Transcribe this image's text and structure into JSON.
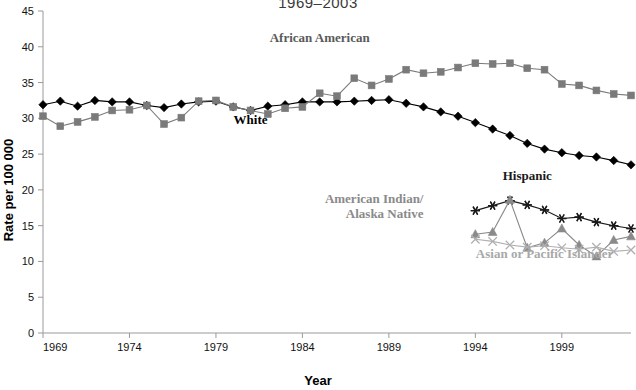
{
  "chart_data": {
    "type": "line",
    "title": "1969–2003",
    "xlabel": "Year",
    "ylabel": "Rate per 100 000",
    "xlim": [
      1969,
      2003
    ],
    "ylim": [
      0,
      45
    ],
    "ytick_step": 5,
    "ytick_labels": [
      "0",
      "5",
      "10",
      "15",
      "20",
      "25",
      "30",
      "35",
      "40",
      "45"
    ],
    "xtick_labels": [
      "1969",
      "1974",
      "1979",
      "1984",
      "1989",
      "1994",
      "1999"
    ],
    "xticks": [
      1969,
      1974,
      1979,
      1984,
      1989,
      1994,
      1999
    ],
    "grid": false,
    "legend_position": "inline-annotations",
    "x": [
      1969,
      1970,
      1971,
      1972,
      1973,
      1974,
      1975,
      1976,
      1977,
      1978,
      1979,
      1980,
      1981,
      1982,
      1983,
      1984,
      1985,
      1986,
      1987,
      1988,
      1989,
      1990,
      1991,
      1992,
      1993,
      1994,
      1995,
      1996,
      1997,
      1998,
      1999,
      2000,
      2001,
      2002,
      2003
    ],
    "series": [
      {
        "name": "White",
        "color": "#000000",
        "marker": "diamond",
        "label_x": 1981,
        "label_y": 29.2,
        "values": [
          31.9,
          32.4,
          31.7,
          32.5,
          32.3,
          32.3,
          31.8,
          31.5,
          32.0,
          32.3,
          32.4,
          31.6,
          31.1,
          31.7,
          31.9,
          32.3,
          32.3,
          32.3,
          32.4,
          32.5,
          32.6,
          32.1,
          31.6,
          30.9,
          30.3,
          29.4,
          28.5,
          27.6,
          26.5,
          25.7,
          25.2,
          24.8,
          24.6,
          24.1,
          23.5
        ]
      },
      {
        "name": "African American",
        "color": "#7a7a7a",
        "marker": "square",
        "label_x": 1985,
        "label_y": 40.6,
        "values": [
          30.3,
          28.9,
          29.5,
          30.2,
          31.1,
          31.2,
          31.8,
          29.2,
          30.1,
          32.4,
          32.5,
          31.6,
          31.1,
          30.6,
          31.4,
          31.6,
          33.5,
          33.1,
          35.6,
          34.6,
          35.5,
          36.8,
          36.3,
          36.5,
          37.1,
          37.7,
          37.6,
          37.7,
          37.0,
          36.8,
          34.8,
          34.6,
          33.9,
          33.4,
          33.2
        ]
      },
      {
        "name": "Hispanic",
        "color": "#1a1a1a",
        "marker": "asterisk",
        "label_x": 1997,
        "label_y": 21.4,
        "start_index": 25,
        "values": [
          null,
          null,
          null,
          null,
          null,
          null,
          null,
          null,
          null,
          null,
          null,
          null,
          null,
          null,
          null,
          null,
          null,
          null,
          null,
          null,
          null,
          null,
          null,
          null,
          null,
          17.1,
          17.8,
          18.5,
          17.9,
          17.2,
          16.0,
          16.2,
          15.5,
          15.0,
          14.6
        ]
      },
      {
        "name": "American Indian/Alaska Native",
        "color": "#8a8a8a",
        "marker": "triangle",
        "label_x": 1991,
        "label_y": 18.2,
        "start_index": 25,
        "values": [
          null,
          null,
          null,
          null,
          null,
          null,
          null,
          null,
          null,
          null,
          null,
          null,
          null,
          null,
          null,
          null,
          null,
          null,
          null,
          null,
          null,
          null,
          null,
          null,
          null,
          13.8,
          14.1,
          18.6,
          11.9,
          12.6,
          14.6,
          12.3,
          10.7,
          13.0,
          13.5
        ]
      },
      {
        "name": "Asian or Pacific Islander",
        "color": "#b0b0b0",
        "marker": "cross",
        "label_x": 1998,
        "label_y": 10.5,
        "start_index": 25,
        "values": [
          null,
          null,
          null,
          null,
          null,
          null,
          null,
          null,
          null,
          null,
          null,
          null,
          null,
          null,
          null,
          null,
          null,
          null,
          null,
          null,
          null,
          null,
          null,
          null,
          null,
          13.1,
          12.8,
          12.3,
          12.0,
          12.2,
          11.9,
          11.7,
          12.0,
          11.4,
          11.6
        ]
      }
    ]
  },
  "axis": {
    "y_title": "Rate per 100 000",
    "x_title": "Year"
  }
}
